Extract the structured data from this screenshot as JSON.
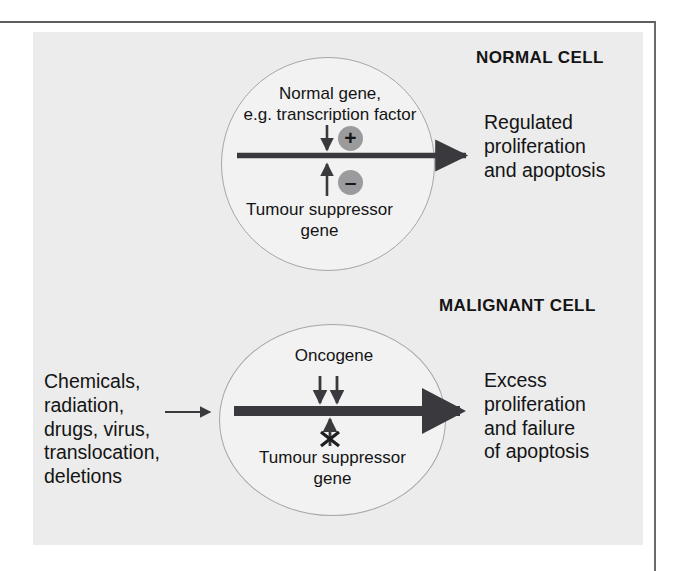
{
  "figure": {
    "panels": [
      {
        "id": "normal",
        "heading": "NORMAL CELL",
        "gene_label": "Normal gene,\ne.g. transcription factor",
        "positive_badge": "+",
        "negative_badge": "–",
        "suppressor_label": "Tumour suppressor\ngene",
        "outcome": "Regulated\nproliferation\nand apoptosis"
      },
      {
        "id": "malignant",
        "heading": "MALIGNANT CELL",
        "gene_label": "Oncogene",
        "suppressor_label": "Tumour suppressor\ngene",
        "inputs": "Chemicals,\nradiation,\ndrugs, virus,\ntranslocation,\ndeletions",
        "outcome": "Excess\nproliferation\nand failure\nof apoptosis"
      }
    ],
    "colors": {
      "panel_background": "#ececec",
      "cell_fill": "#f2f2f2",
      "cell_stroke": "#a6a6a8",
      "badge_fill": "#9b9b9d",
      "arrow": "#3a3a3e",
      "text": "#141414"
    }
  }
}
